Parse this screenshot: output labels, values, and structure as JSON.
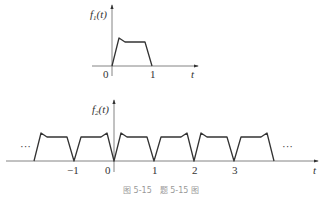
{
  "figure": {
    "top_plot": {
      "y_label": "f",
      "y_label_sub": "1",
      "y_label_arg": "(t)",
      "x_label": "t",
      "ticks": [
        {
          "value": 0,
          "label": "0"
        },
        {
          "value": 1,
          "label": "1"
        }
      ],
      "description": "single pulse on [0,1]: rises steeply to a peak near t=0.2, dips slightly to a flat top, then falls linearly to 0 at t=1"
    },
    "bottom_plot": {
      "y_label": "f",
      "y_label_sub": "2",
      "y_label_arg": "(t)",
      "x_label": "t",
      "ticks": [
        {
          "value": -1,
          "label": "−1"
        },
        {
          "value": 0,
          "label": "0"
        },
        {
          "value": 1,
          "label": "1"
        },
        {
          "value": 2,
          "label": "2"
        },
        {
          "value": 3,
          "label": "3"
        }
      ],
      "ellipsis_left": "···",
      "ellipsis_right": "···",
      "description": "periodic signal with period 2: f1(t) on [0,1] and its mirror f1(-t) on [-1,0], repeated"
    },
    "caption": "图 5-15　题 5-15 图"
  },
  "colors": {
    "line": "#333333",
    "axis": "#555555",
    "caption": "#999999"
  }
}
